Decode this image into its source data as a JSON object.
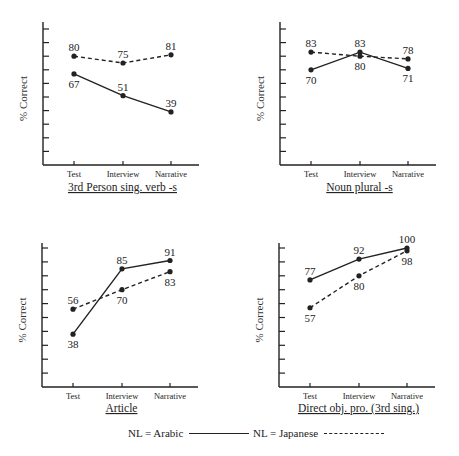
{
  "chart_data": [
    {
      "type": "line",
      "title": "3rd Person sing. verb -s",
      "xlabel": "",
      "ylabel": "% Correct",
      "categories": [
        "Test",
        "Interview",
        "Narrative"
      ],
      "ylim": [
        0,
        100
      ],
      "yticks": [
        10,
        20,
        30,
        40,
        50,
        60,
        70,
        80,
        90,
        100
      ],
      "grid": false,
      "series": [
        {
          "name": "NL = Arabic",
          "style": "solid",
          "values": [
            67,
            51,
            39
          ]
        },
        {
          "name": "NL = Japanese",
          "style": "dashed",
          "values": [
            80,
            75,
            81
          ]
        }
      ]
    },
    {
      "type": "line",
      "title": "Noun plural -s",
      "xlabel": "",
      "ylabel": "% Correct",
      "categories": [
        "Test",
        "Interview",
        "Narrative"
      ],
      "ylim": [
        0,
        100
      ],
      "yticks": [
        10,
        20,
        30,
        40,
        50,
        60,
        70,
        80,
        90,
        100
      ],
      "grid": false,
      "series": [
        {
          "name": "NL = Arabic",
          "style": "solid",
          "values": [
            70,
            83,
            71
          ]
        },
        {
          "name": "NL = Japanese",
          "style": "dashed",
          "values": [
            83,
            80,
            78
          ]
        }
      ]
    },
    {
      "type": "line",
      "title": "Article",
      "xlabel": "",
      "ylabel": "% Correct",
      "categories": [
        "Test",
        "Interview",
        "Narrative"
      ],
      "ylim": [
        0,
        100
      ],
      "yticks": [
        10,
        20,
        30,
        40,
        50,
        60,
        70,
        80,
        90,
        100
      ],
      "grid": false,
      "series": [
        {
          "name": "NL = Arabic",
          "style": "solid",
          "values": [
            38,
            85,
            91
          ]
        },
        {
          "name": "NL = Japanese",
          "style": "dashed",
          "values": [
            56,
            70,
            83
          ]
        }
      ]
    },
    {
      "type": "line",
      "title": "Direct obj. pro. (3rd sing.)",
      "xlabel": "",
      "ylabel": "% Correct",
      "categories": [
        "Test",
        "Interview",
        "Narrative"
      ],
      "ylim": [
        0,
        100
      ],
      "yticks": [
        10,
        20,
        30,
        40,
        50,
        60,
        70,
        80,
        90,
        100
      ],
      "grid": false,
      "series": [
        {
          "name": "NL = Arabic",
          "style": "solid",
          "values": [
            77,
            92,
            100
          ]
        },
        {
          "name": "NL = Japanese",
          "style": "dashed",
          "values": [
            57,
            80,
            98
          ]
        }
      ]
    }
  ],
  "legend": {
    "position": "bottom",
    "items": [
      {
        "label": "NL = Arabic",
        "style": "solid"
      },
      {
        "label": "NL = Japanese",
        "style": "dashed"
      }
    ]
  },
  "colors": {
    "line": "#222222",
    "background": "#ffffff"
  }
}
